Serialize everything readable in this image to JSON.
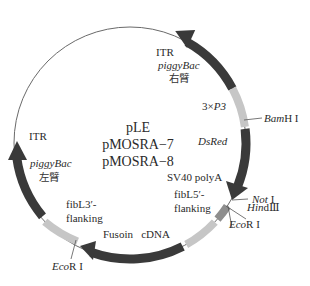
{
  "title": {
    "lines": [
      "pLE",
      "pMOSRA−7",
      "pMOSRA−8"
    ]
  },
  "colors": {
    "background": "#ffffff",
    "backbone": "#555555",
    "dark_segment": "#3a3a3a",
    "light_segment": "#c6c6c6",
    "mid_segment": "#8e8e8e",
    "text": "#2a2a2a"
  },
  "segments": [
    {
      "id": "itr-right",
      "label_lines": [
        "ITR",
        "piggyBac",
        "右臂"
      ],
      "shade": "dark",
      "arrow": "counterclockwise"
    },
    {
      "id": "3xp3",
      "label": "3×P3",
      "label_prefix": "3×",
      "label_italic": "P3",
      "shade": "light"
    },
    {
      "id": "dsred",
      "label": "DsRed",
      "shade": "dark",
      "arrow": "clockwise"
    },
    {
      "id": "sv40",
      "label": "SV40 polyA",
      "shade": "mid"
    },
    {
      "id": "fibl5",
      "label_lines": [
        "fibL5′-",
        "flanking"
      ],
      "shade": "light"
    },
    {
      "id": "fusoin",
      "label": "Fusoin   cDNA",
      "shade": "dark",
      "arrow": "clockwise"
    },
    {
      "id": "fibl3",
      "label_lines": [
        "fibL3′-",
        "flanking"
      ],
      "shade": "light"
    },
    {
      "id": "itr-left",
      "label_lines": [
        "ITR",
        "piggyBac",
        "左臂"
      ],
      "shade": "dark",
      "arrow": "clockwise"
    }
  ],
  "restriction_sites": [
    {
      "id": "bamhi",
      "italic": "Bam",
      "rest": "H I"
    },
    {
      "id": "noti",
      "italic": "Not",
      "rest": " I"
    },
    {
      "id": "hindiii",
      "italic": "Hin",
      "rest": "dⅢ"
    },
    {
      "id": "ecori-right",
      "italic": "Eco",
      "rest": "R I"
    },
    {
      "id": "ecori-left",
      "italic": "Eco",
      "rest": "R I"
    }
  ]
}
